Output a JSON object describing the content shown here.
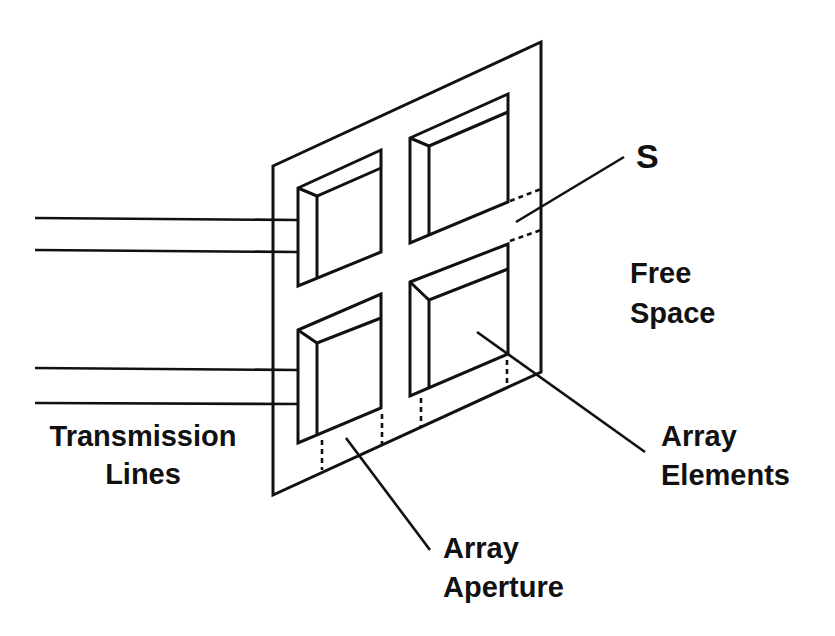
{
  "figure": {
    "type": "antenna-array-schematic",
    "labels": {
      "s": "S",
      "free_space_line1": "Free",
      "free_space_line2": "Space",
      "transmission_line1": "Transmission",
      "transmission_line2": "Lines",
      "elements_line1": "Array",
      "elements_line2": "Elements",
      "aperture_line1": "Array",
      "aperture_line2": "Aperture"
    },
    "element_count": 4,
    "transmission_line_pairs": 2,
    "colors": {
      "ink": "#111111",
      "background": "#ffffff"
    }
  }
}
